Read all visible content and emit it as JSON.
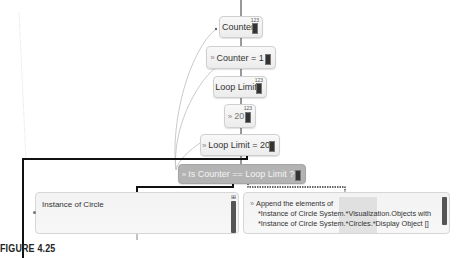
{
  "nodes": [
    {
      "id": "counter",
      "label": "Counter",
      "badge": "123"
    },
    {
      "id": "set_counter",
      "prefix": "»",
      "label": "Counter = 1"
    },
    {
      "id": "loop_limit",
      "label": "Loop Limit",
      "badge": "123"
    },
    {
      "id": "const_20",
      "prefix": "»",
      "label": "20",
      "badge": "123"
    },
    {
      "id": "set_loop_limit",
      "prefix": "»",
      "label": "Loop Limit = 20"
    },
    {
      "id": "condition",
      "prefix": "»",
      "label": "Is Counter == Loop Limit ?"
    }
  ],
  "instance_box": {
    "label": "Instance of Circle",
    "badge": "⊞"
  },
  "append_box": {
    "prefix": "»",
    "line1": "Append the elements of",
    "line2": "*Instance of Circle System.*Visualization.Objects with",
    "line3": "*Instance of Circle System.*Circles.*Display Object []"
  },
  "caption": "FIGURE 4.25",
  "colors": {
    "selected_node": "#b3b3b3",
    "node_bg": "#f0f0f0",
    "wire": "#111111",
    "dotted_wire": "#333333",
    "curve": "#bbbbbb"
  }
}
